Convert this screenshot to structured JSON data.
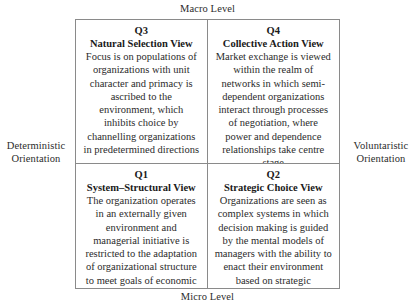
{
  "figure": {
    "axes": {
      "top_label": "Macro Level",
      "bottom_label": "Micro Level",
      "left_label": "Deterministic Orientation",
      "right_label": "Voluntaristic Orientation"
    },
    "quadrants": [
      {
        "id": "Q3",
        "position": "top-left",
        "title": "Natural Selection View",
        "body": "Focus is on populations of organizations with unit character and primacy is ascribed to the environment, which inhibits choice by channelling organizations in predetermined directions"
      },
      {
        "id": "Q4",
        "position": "top-right",
        "title": "Collective Action View",
        "body": "Market exchange is viewed within the realm of networks in which semi-dependent organizations interact through processes of negotiation, where power and dependence relationships take centre stage"
      },
      {
        "id": "Q1",
        "position": "bottom-left",
        "title": "System–Structural View",
        "body": "The organization operates in an externally given environment and managerial initiative is restricted to the adaptation of organizational structure to meet goals of economic efficiency"
      },
      {
        "id": "Q2",
        "position": "bottom-right",
        "title": "Strategic Choice View",
        "body": "Organizations are seen as complex systems in which decision making is guided by the mental models of managers with the ability to enact their environment based on strategic considerations"
      }
    ],
    "colors": {
      "border": "#8a8a8a",
      "text": "#2b2b2b",
      "background": "#ffffff"
    }
  }
}
